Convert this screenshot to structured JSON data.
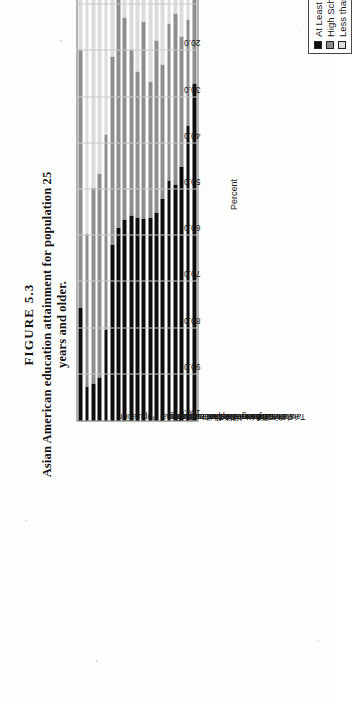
{
  "figure": {
    "number": "FIGURE 5.3",
    "caption": "Asian American education attainment for population 25 years and older."
  },
  "legend": {
    "items": [
      {
        "label": "At Least a BA/BS",
        "color": "#0d0d0d"
      },
      {
        "label": "High School Diploma",
        "color": "#8e8e8e"
      },
      {
        "label": "Less than High School Diploma",
        "color": "#dcdcdc"
      }
    ]
  },
  "chart_data": {
    "type": "bar",
    "subtype": "stacked-100-percent",
    "title": "Asian American education attainment for population 25 years and older.",
    "xlabel": "",
    "ylabel": "Percent",
    "ylim": [
      0,
      100
    ],
    "ytick_labels": [
      "0.0",
      "10.0",
      "20.0",
      "30.0",
      "40.0",
      "50.0",
      "60.0",
      "70.0",
      "80.0",
      "90.0",
      "100.0"
    ],
    "yticks": [
      0,
      10,
      20,
      30,
      40,
      50,
      60,
      70,
      80,
      90,
      100
    ],
    "grid": true,
    "legend_position": "right",
    "categories": [
      "National Population",
      "Hmong",
      "Laotian",
      "Cambodian",
      "Vietnamese",
      "Thai",
      "Japanese",
      "Filipino",
      "All Asian",
      "Indonesian",
      "Korean",
      "Bangladeshi",
      "Other Asian",
      "Chinese",
      "Malaysian",
      "Sri Lankan",
      "Pakistani",
      "Asian Indian",
      "Taiwanese"
    ],
    "series": [
      {
        "name": "Less than High School Diploma",
        "color": "#dcdcdc",
        "values": [
          19.6,
          59.6,
          49.6,
          46.6,
          38.1,
          21.3,
          8.9,
          12.7,
          19.6,
          24.5,
          13.7,
          26.6,
          17.8,
          23.0,
          14.1,
          12.0,
          16.8,
          13.3,
          6.5
        ]
      },
      {
        "name": "High School Diploma",
        "color": "#8e8e8e",
        "values": [
          56.0,
          33.0,
          42.3,
          44.1,
          42.3,
          40.5,
          49.4,
          43.7,
          36.0,
          31.5,
          42.6,
          29.5,
          37.2,
          29.0,
          33.9,
          37.0,
          28.2,
          22.9,
          20.5
        ]
      },
      {
        "name": "At Least a BA/BS",
        "color": "#0d0d0d",
        "values": [
          24.4,
          7.4,
          8.1,
          9.3,
          19.6,
          38.2,
          41.7,
          43.6,
          44.4,
          44.0,
          43.7,
          43.9,
          45.0,
          48.0,
          52.0,
          51.0,
          55.0,
          63.8,
          73.0
        ]
      }
    ]
  }
}
